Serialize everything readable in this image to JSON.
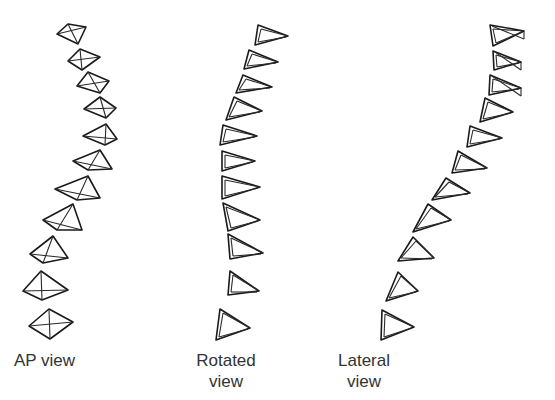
{
  "figure": {
    "colors": {
      "stroke": "#1a1a1a",
      "label": "#333333",
      "background": "#ffffff"
    },
    "columns": [
      {
        "id": "ap",
        "label_line1": "AP view",
        "label_line2": "",
        "shape": "diamond",
        "segments": [
          [
            [
              57,
              34
            ],
            [
              68,
              24
            ],
            [
              86,
              27
            ],
            [
              78,
              44
            ]
          ],
          [
            [
              68,
              61
            ],
            [
              80,
              49
            ],
            [
              100,
              57
            ],
            [
              82,
              70
            ]
          ],
          [
            [
              77,
              86
            ],
            [
              88,
              72
            ],
            [
              109,
              81
            ],
            [
              100,
              93
            ]
          ],
          [
            [
              84,
              109
            ],
            [
              100,
              97
            ],
            [
              116,
              108
            ],
            [
              106,
              118
            ]
          ],
          [
            [
              83,
              136
            ],
            [
              106,
              124
            ],
            [
              117,
              139
            ],
            [
              105,
              145
            ]
          ],
          [
            [
              73,
              161
            ],
            [
              100,
              150
            ],
            [
              112,
              169
            ],
            [
              88,
              170
            ]
          ],
          [
            [
              55,
              189
            ],
            [
              88,
              176
            ],
            [
              100,
              198
            ],
            [
              77,
              200
            ]
          ],
          [
            [
              43,
              220
            ],
            [
              73,
              204
            ],
            [
              82,
              230
            ],
            [
              57,
              230
            ]
          ],
          [
            [
              30,
              254
            ],
            [
              53,
              236
            ],
            [
              68,
              258
            ],
            [
              43,
              263
            ]
          ],
          [
            [
              23,
              291
            ],
            [
              41,
              271
            ],
            [
              68,
              290
            ],
            [
              42,
              300
            ]
          ],
          [
            [
              29,
              326
            ],
            [
              49,
              309
            ],
            [
              73,
              322
            ],
            [
              50,
              339
            ]
          ]
        ]
      },
      {
        "id": "rotated",
        "label_line1": "Rotated",
        "label_line2": "view",
        "shape": "triangle",
        "segments": [
          [
            [
              258,
              25
            ],
            [
              255,
              45
            ],
            [
              288,
              36
            ]
          ],
          [
            [
              249,
              50
            ],
            [
              244,
              69
            ],
            [
              278,
              62
            ]
          ],
          [
            [
              243,
              75
            ],
            [
              236,
              93
            ],
            [
              272,
              87
            ]
          ],
          [
            [
              234,
              97
            ],
            [
              226,
              120
            ],
            [
              262,
              111
            ]
          ],
          [
            [
              223,
              125
            ],
            [
              220,
              145
            ],
            [
              257,
              136
            ]
          ],
          [
            [
              222,
              151
            ],
            [
              222,
              171
            ],
            [
              255,
              161
            ]
          ],
          [
            [
              222,
              176
            ],
            [
              222,
              199
            ],
            [
              260,
              187
            ]
          ],
          [
            [
              223,
              203
            ],
            [
              228,
              231
            ],
            [
              260,
              220
            ]
          ],
          [
            [
              228,
              234
            ],
            [
              230,
              259
            ],
            [
              263,
              253
            ]
          ],
          [
            [
              230,
              271
            ],
            [
              228,
              295
            ],
            [
              259,
              291
            ]
          ],
          [
            [
              220,
              309
            ],
            [
              216,
              340
            ],
            [
              250,
              328
            ]
          ]
        ]
      },
      {
        "id": "lateral",
        "label_line1": "Lateral",
        "label_line2": "view",
        "shape": "triangle",
        "segments": [
          [
            [
              490,
              25
            ],
            [
              493,
              46
            ],
            [
              524,
              31
            ]
          ],
          [
            [
              493,
              51
            ],
            [
              494,
              70
            ],
            [
              521,
              62
            ]
          ],
          [
            [
              490,
              75
            ],
            [
              489,
              95
            ],
            [
              521,
              88
            ]
          ],
          [
            [
              485,
              98
            ],
            [
              480,
              122
            ],
            [
              513,
              112
            ]
          ],
          [
            [
              470,
              126
            ],
            [
              467,
              147
            ],
            [
              502,
              138
            ]
          ],
          [
            [
              458,
              151
            ],
            [
              452,
              173
            ],
            [
              487,
              168
            ]
          ],
          [
            [
              446,
              178
            ],
            [
              432,
              200
            ],
            [
              470,
              193
            ]
          ],
          [
            [
              428,
              204
            ],
            [
              413,
              232
            ],
            [
              451,
              220
            ]
          ],
          [
            [
              413,
              237
            ],
            [
              398,
              261
            ],
            [
              434,
              258
            ]
          ],
          [
            [
              398,
              272
            ],
            [
              386,
              301
            ],
            [
              418,
              291
            ]
          ],
          [
            [
              382,
              310
            ],
            [
              381,
              340
            ],
            [
              414,
              327
            ]
          ]
        ]
      }
    ]
  },
  "labels": {
    "ap": {
      "line1": "AP view"
    },
    "rotated": {
      "line1": "Rotated",
      "line2": "view"
    },
    "lateral": {
      "line1": "Lateral",
      "line2": "view"
    }
  }
}
